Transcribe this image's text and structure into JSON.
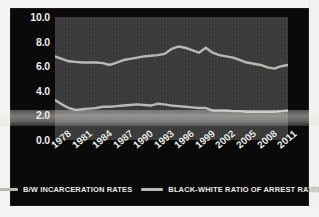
{
  "chart_data": {
    "type": "line",
    "title": "",
    "xlabel": "",
    "ylabel": "",
    "ylim": [
      0.0,
      10.0
    ],
    "yticks": [
      "0.0",
      "2.0",
      "4.0",
      "6.0",
      "8.0",
      "10.0"
    ],
    "grid": false,
    "legend_position": "bottom",
    "categories": [
      1978,
      1979,
      1980,
      1981,
      1982,
      1983,
      1984,
      1985,
      1986,
      1987,
      1988,
      1989,
      1990,
      1991,
      1992,
      1993,
      1994,
      1995,
      1996,
      1997,
      1998,
      1999,
      2000,
      2001,
      2002,
      2003,
      2004,
      2005,
      2006,
      2007,
      2008,
      2009,
      2010,
      2011,
      2012
    ],
    "xtick_labels": [
      "1978",
      "1981",
      "1984",
      "1987",
      "1990",
      "1993",
      "1996",
      "1999",
      "2002",
      "2005",
      "2008",
      "2011"
    ],
    "series": [
      {
        "name": "B/W INCARCERATION RATES",
        "color": "#b9b9b4",
        "values": [
          6.8,
          6.6,
          6.4,
          6.35,
          6.3,
          6.3,
          6.3,
          6.25,
          6.1,
          6.3,
          6.5,
          6.6,
          6.7,
          6.8,
          6.85,
          6.9,
          7.0,
          7.4,
          7.6,
          7.5,
          7.3,
          7.1,
          7.5,
          7.1,
          6.9,
          6.8,
          6.7,
          6.5,
          6.3,
          6.2,
          6.1,
          5.9,
          5.8,
          6.0,
          6.1
        ]
      },
      {
        "name": "BLACK-WHITE RATIO OF ARREST RATES",
        "color": "#b9b9b4",
        "values": [
          3.25,
          2.9,
          2.6,
          2.45,
          2.5,
          2.55,
          2.6,
          2.7,
          2.7,
          2.75,
          2.8,
          2.85,
          2.9,
          2.85,
          2.8,
          2.95,
          2.9,
          2.8,
          2.75,
          2.7,
          2.65,
          2.6,
          2.6,
          2.4,
          2.4,
          2.4,
          2.35,
          2.35,
          2.3,
          2.3,
          2.3,
          2.3,
          2.3,
          2.35,
          2.4
        ]
      }
    ]
  },
  "legend": {
    "items": [
      {
        "label": "B/W INCARCERATION RATES"
      },
      {
        "label": "BLACK-WHITE RATIO OF ARREST RATES"
      }
    ]
  }
}
